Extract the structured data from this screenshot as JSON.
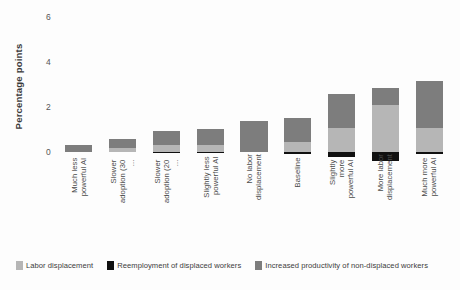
{
  "chart_data": {
    "type": "bar",
    "subtype": "stacked-bar",
    "title": "",
    "xlabel": "",
    "ylabel": "Percentage points",
    "ylim": [
      -0.55,
      6.4
    ],
    "yticks": [
      0,
      2,
      4,
      6
    ],
    "ytick_labels": [
      "0",
      "2",
      "4",
      "6"
    ],
    "grid": false,
    "legend_position": "bottom",
    "categories": [
      "Much less\npowerful AI",
      "Slower\nadoption (30 ...",
      "Slower\nadoption (20 ...",
      "Slightly less\npowerful AI",
      "No labor\ndisplacement",
      "Baseline",
      "Slightly more\npowerful AI",
      "More labor\ndisplacement",
      "Much more\npowerful AI"
    ],
    "series": [
      {
        "name": "Labor displacement",
        "color": "#b6b6b6",
        "values": [
          0.0,
          0.18,
          0.3,
          0.3,
          0.0,
          0.45,
          1.05,
          2.1,
          1.05
        ]
      },
      {
        "name": "Reemployment of displaced workers",
        "color": "#101010",
        "values": [
          0.0,
          0.0,
          -0.05,
          -0.05,
          0.0,
          -0.12,
          -0.22,
          -0.42,
          -0.12
        ]
      },
      {
        "name": "Increased productivity of non-displaced workers",
        "color": "#7d7d7d",
        "values": [
          0.28,
          0.37,
          0.6,
          0.7,
          1.38,
          1.05,
          1.52,
          0.75,
          2.1
        ]
      }
    ],
    "bar_totals": [
      0.28,
      0.55,
      0.9,
      1.0,
      1.38,
      1.5,
      2.57,
      2.85,
      3.15
    ]
  },
  "axis": {
    "y_title": "Percentage points"
  },
  "legend": {
    "items": [
      {
        "label": "Labor displacement",
        "color": "#b6b6b6",
        "swatch": "legend-swatch-labor-displacement"
      },
      {
        "label": "Reemployment of displaced workers",
        "color": "#101010",
        "swatch": "legend-swatch-reemployment"
      },
      {
        "label": "Increased productivity of non-displaced workers",
        "color": "#7d7d7d",
        "swatch": "legend-swatch-productivity"
      }
    ]
  }
}
